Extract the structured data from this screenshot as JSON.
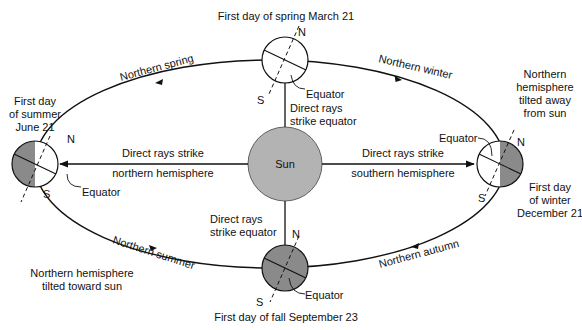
{
  "colors": {
    "background": "#ffffff",
    "line": "#111111",
    "sun_fill": "#b3b3b3",
    "shade_fill": "#8a8a8a",
    "light_fill": "#ffffff"
  },
  "sun": {
    "label": "Sun"
  },
  "orbit": {
    "segments": [
      {
        "label": "Northern spring"
      },
      {
        "label": "Northern winter"
      },
      {
        "label": "Northern summer"
      },
      {
        "label": "Northern autumn"
      }
    ]
  },
  "globes": {
    "spring": {
      "title": "First day of spring March 21",
      "north_label": "N",
      "south_label": "S",
      "equator_label": "Equator",
      "rays_line1": "Direct rays",
      "rays_line2": "strike equator"
    },
    "summer": {
      "title_line1": "First day",
      "title_line2": "of summer",
      "title_line3": "June 21",
      "north_label": "N",
      "south_label": "S",
      "equator_label": "Equator",
      "rays_line1": "Direct rays strike",
      "rays_line2": "northern hemisphere",
      "tilt_line1": "Northern hemisphere",
      "tilt_line2": "tilted toward sun"
    },
    "winter": {
      "title_line1": "First day",
      "title_line2": "of winter",
      "title_line3": "December 21",
      "north_label": "N",
      "south_label": "S",
      "equator_label": "Equator",
      "rays_line1": "Direct rays strike",
      "rays_line2": "southern hemisphere",
      "tilt_line1": "Northern",
      "tilt_line2": "hemisphere",
      "tilt_line3": "tilted away",
      "tilt_line4": "from sun"
    },
    "fall": {
      "title": "First day of fall September 23",
      "north_label": "N",
      "south_label": "S",
      "equator_label": "Equator",
      "rays_line1": "Direct rays",
      "rays_line2": "strike equator"
    }
  }
}
